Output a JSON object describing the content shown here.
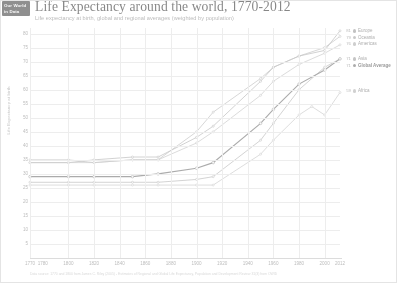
{
  "brand": {
    "line1": "Our World",
    "line2": "in Data"
  },
  "header": {
    "title": "Life Expectancy around the world, 1770-2012",
    "subtitle": "Life expectancy at birth, global and regional averages (weighted by population)"
  },
  "source": "Data source: 1770 and 1800 from James C. Riley (2005) - Estimates of Regional and Global Life Expectancy, Population and Development Review 31(3) from OWID",
  "chart_data": {
    "type": "line",
    "title": "Life Expectancy around the world, 1770-2012",
    "subtitle": "Life expectancy at birth, global and regional averages (weighted by population)",
    "xlabel": "",
    "ylabel": "Life Expectancy at birth",
    "xlim": [
      1770,
      2012
    ],
    "ylim": [
      0,
      82
    ],
    "grid": true,
    "legend_position": "right",
    "yticks": [
      80,
      75,
      70,
      65,
      60,
      55,
      50,
      45,
      40,
      35,
      30,
      25,
      20,
      15,
      10,
      5
    ],
    "xticks": [
      1770,
      1780,
      1800,
      1820,
      1840,
      1860,
      1880,
      1900,
      1920,
      1940,
      1960,
      1980,
      2000,
      2012
    ],
    "series": [
      {
        "name": "Europe",
        "color": "#9a9a9a",
        "end_value": 81,
        "x": [
          1770,
          1800,
          1820,
          1850,
          1870,
          1900,
          1913,
          1950,
          1960,
          1980,
          2000,
          2012
        ],
        "y": [
          34,
          34,
          35,
          36,
          36,
          43,
          47,
          63,
          68,
          72,
          74,
          81
        ]
      },
      {
        "name": "Oceania",
        "color": "#a5a5a5",
        "end_value": 79,
        "x": [
          1770,
          1800,
          1820,
          1850,
          1870,
          1900,
          1913,
          1950,
          1960,
          1980,
          2000,
          2012
        ],
        "y": [
          35,
          35,
          34,
          35,
          35,
          45,
          52,
          64,
          68,
          72,
          75,
          79
        ]
      },
      {
        "name": "Americas",
        "color": "#b0b0b0",
        "end_value": 76,
        "x": [
          1770,
          1800,
          1820,
          1850,
          1870,
          1900,
          1913,
          1950,
          1960,
          1980,
          2000,
          2012
        ],
        "y": [
          34,
          34,
          34,
          35,
          35,
          41,
          45,
          58,
          63,
          69,
          73,
          76
        ]
      },
      {
        "name": "Asia",
        "color": "#9e9e9e",
        "end_value": 71,
        "x": [
          1770,
          1800,
          1820,
          1850,
          1870,
          1900,
          1913,
          1950,
          1960,
          1980,
          2000,
          2012
        ],
        "y": [
          27,
          27,
          27,
          27,
          27,
          28,
          29,
          42,
          48,
          60,
          68,
          71
        ]
      },
      {
        "name": "Global Average",
        "color": "#6e6e6e",
        "end_value": 71,
        "bold": true,
        "x": [
          1770,
          1800,
          1820,
          1850,
          1870,
          1900,
          1913,
          1950,
          1960,
          1980,
          2000,
          2012
        ],
        "y": [
          29,
          29,
          29,
          29,
          30,
          32,
          34,
          48,
          53,
          62,
          67,
          71
        ]
      },
      {
        "name": "Africa",
        "color": "#b5b5b5",
        "end_value": 59,
        "x": [
          1770,
          1800,
          1820,
          1850,
          1870,
          1900,
          1913,
          1950,
          1960,
          1980,
          1990,
          2000,
          2012
        ],
        "y": [
          26,
          26,
          26,
          26,
          26,
          26,
          26,
          37,
          42,
          51,
          54,
          51,
          59
        ]
      }
    ]
  }
}
